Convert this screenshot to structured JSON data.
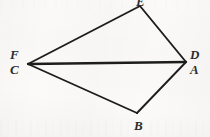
{
  "figure": {
    "kind": "geometry-line-diagram",
    "stroke_color": "#1d1d1d",
    "background_color": "#fbfaf8",
    "canvas": {
      "width": 210,
      "height": 137
    },
    "vertices": [
      {
        "id": "top",
        "labels": [
          "E"
        ],
        "x": 140,
        "y": 6,
        "label_x": 136,
        "label_y": -4,
        "clipped": true
      },
      {
        "id": "right",
        "labels": [
          "D",
          "A"
        ],
        "x": 186,
        "y": 62,
        "label_x": 190,
        "label_y": 49
      },
      {
        "id": "bottom",
        "labels": [
          "B"
        ],
        "x": 137,
        "y": 113,
        "label_x": 134,
        "label_y": 120
      },
      {
        "id": "left",
        "labels": [
          "F",
          "C"
        ],
        "x": 28,
        "y": 64,
        "label_x": 10,
        "label_y": 49
      }
    ],
    "edges": [
      {
        "from": "left",
        "to": "top",
        "name": "edge-C-E"
      },
      {
        "from": "top",
        "to": "right",
        "name": "edge-E-D"
      },
      {
        "from": "right",
        "to": "bottom",
        "name": "edge-A-B"
      },
      {
        "from": "bottom",
        "to": "left",
        "name": "edge-B-C"
      },
      {
        "from": "left",
        "to": "right",
        "name": "diagonal-C-A"
      }
    ],
    "labels": {
      "top_vertex": "E",
      "right_upper": "D",
      "right_lower": "A",
      "bottom_vertex": "B",
      "left_upper": "F",
      "left_lower": "C"
    }
  }
}
